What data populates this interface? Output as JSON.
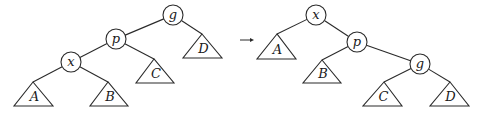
{
  "diagram": {
    "type": "tree-rotation",
    "before": {
      "nodes": [
        {
          "id": "g",
          "label": "g",
          "x": 173,
          "y": 15
        },
        {
          "id": "p",
          "label": "p",
          "x": 116,
          "y": 39
        },
        {
          "id": "x",
          "label": "x",
          "x": 71,
          "y": 62
        }
      ],
      "subtrees": [
        {
          "id": "A",
          "label": "A",
          "apex": [
            33,
            82
          ],
          "base_y": 106,
          "left": 14,
          "right": 53
        },
        {
          "id": "B",
          "label": "B",
          "apex": [
            108,
            82
          ],
          "base_y": 106,
          "left": 90,
          "right": 128
        },
        {
          "id": "C",
          "label": "C",
          "apex": [
            154,
            59
          ],
          "base_y": 83,
          "left": 136,
          "right": 174
        },
        {
          "id": "D",
          "label": "D",
          "apex": [
            202,
            34
          ],
          "base_y": 58,
          "left": 183,
          "right": 222
        }
      ],
      "edges": [
        [
          "g",
          "p"
        ],
        [
          "g",
          "D"
        ],
        [
          "p",
          "x"
        ],
        [
          "p",
          "C"
        ],
        [
          "x",
          "A"
        ],
        [
          "x",
          "B"
        ]
      ]
    },
    "arrow": {
      "symbol": "→",
      "from": [
        240,
        40
      ],
      "to": [
        254,
        40
      ]
    },
    "after": {
      "nodes": [
        {
          "id": "x",
          "label": "x",
          "x": 316,
          "y": 15
        },
        {
          "id": "p",
          "label": "p",
          "x": 357,
          "y": 42
        },
        {
          "id": "g",
          "label": "g",
          "x": 420,
          "y": 64
        }
      ],
      "subtrees": [
        {
          "id": "A",
          "label": "A",
          "apex": [
            277,
            34
          ],
          "base_y": 59,
          "left": 257,
          "right": 296
        },
        {
          "id": "B",
          "label": "B",
          "apex": [
            322,
            60
          ],
          "base_y": 83,
          "left": 303,
          "right": 341
        },
        {
          "id": "C",
          "label": "C",
          "apex": [
            384,
            82
          ],
          "base_y": 106,
          "left": 363,
          "right": 402
        },
        {
          "id": "D",
          "label": "D",
          "apex": [
            450,
            82
          ],
          "base_y": 106,
          "left": 430,
          "right": 469
        }
      ],
      "edges": [
        [
          "x",
          "A"
        ],
        [
          "x",
          "p"
        ],
        [
          "p",
          "B"
        ],
        [
          "p",
          "g"
        ],
        [
          "g",
          "C"
        ],
        [
          "g",
          "D"
        ]
      ]
    },
    "node_radius": 10
  }
}
